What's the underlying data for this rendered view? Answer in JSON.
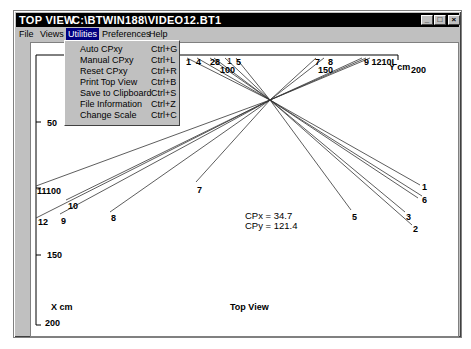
{
  "window": {
    "title_app": "TOP VIEW",
    "title_file": "C:\\BTWIN188\\VIDEO12.BT1",
    "controls": {
      "minimize": "_",
      "maximize": "□",
      "close": "×"
    }
  },
  "menubar": {
    "items": [
      {
        "label": "File",
        "mnemonic": "F"
      },
      {
        "label": "Views",
        "mnemonic": "V"
      },
      {
        "label": "Utilities",
        "mnemonic": "U",
        "active": true
      },
      {
        "label": "Preferences",
        "mnemonic": "P"
      },
      {
        "label": "Help",
        "mnemonic": "H"
      }
    ]
  },
  "utilities_menu": {
    "items": [
      {
        "label": "Auto CPxy",
        "shortcut": "Ctrl+G"
      },
      {
        "label": "Manual CPxy",
        "shortcut": "Ctrl+L"
      },
      {
        "label": "Reset CPxy",
        "shortcut": "Ctrl+R"
      },
      {
        "label": "Print Top View",
        "shortcut": "Ctrl+B"
      },
      {
        "label": "Save to Clipboard",
        "shortcut": "Ctrl+S"
      },
      {
        "label": "File Information",
        "shortcut": "Ctrl+Z"
      },
      {
        "label": "Change Scale",
        "shortcut": "Ctrl+C"
      }
    ]
  },
  "plot": {
    "title": "Top View",
    "x_axis_label": "X cm",
    "y_axis_label": "Y cm",
    "y_ticks_top": [
      "100",
      "150",
      "200"
    ],
    "x_ticks_left": [
      "50",
      "100",
      "150",
      "200"
    ],
    "cp": {
      "x_label": "CPx = 34.7",
      "y_label": "CPy = 121.4"
    },
    "top_ray_labels": [
      "1",
      "4",
      "2",
      "8",
      "1",
      "5",
      "7",
      "8",
      "9",
      "12",
      "10",
      "11"
    ],
    "ray_labels_combined_top": [
      "1",
      "4",
      "28",
      "1",
      "5",
      "7",
      "8",
      "9 1210L"
    ],
    "left_ray_labels": [
      "11",
      "10",
      "12",
      "9",
      "8",
      "7"
    ],
    "right_ray_labels": [
      "1",
      "6",
      "5",
      "3",
      "2"
    ]
  },
  "colors": {
    "titlebar_bg": "#000000",
    "menu_active_bg": "#000080",
    "chrome_bg": "#c0c0c0",
    "plot_bg": "#ffffff",
    "line": "#000000"
  }
}
